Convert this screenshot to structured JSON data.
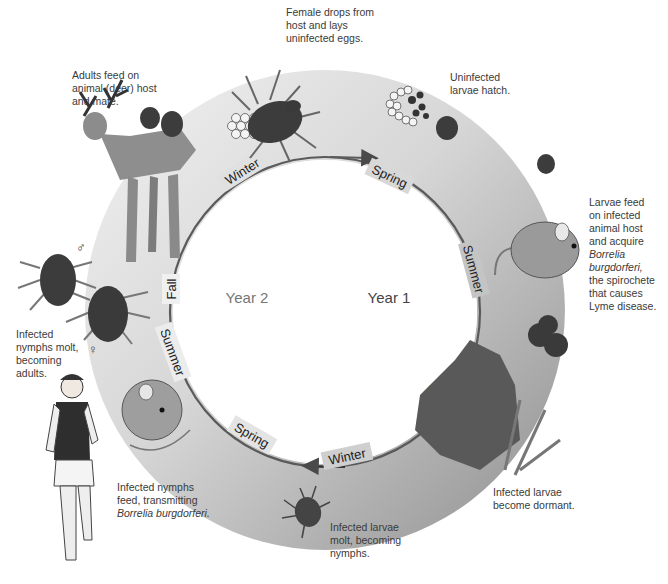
{
  "diagram": {
    "center_labels": {
      "year1": "Year 1",
      "year2": "Year 2"
    },
    "seasons": {
      "year1": [
        "Spring",
        "Summer",
        "Fall",
        "Winter"
      ],
      "year2": [
        "Spring",
        "Summer",
        "Fall",
        "Winter"
      ]
    },
    "colors": {
      "ring_light": "#e6e6e6",
      "ring_dark": "#9a9a9a",
      "arc_line": "#5a5a5a",
      "tick_body": "#3c3c3c",
      "caption_text": "#3a3a3a",
      "year_text": "#777777"
    },
    "stages": [
      {
        "id": "eggs",
        "lines": [
          "Female drops from",
          "host and lays",
          "uninfected eggs."
        ]
      },
      {
        "id": "hatch",
        "lines": [
          "Uninfected",
          "larvae hatch."
        ]
      },
      {
        "id": "larvae-feed",
        "lines": [
          "Larvae feed",
          "on infected",
          "animal host",
          "and acquire"
        ],
        "italic_lines": [
          "Borrelia",
          "burgdorferi,"
        ],
        "tail_lines": [
          "the spirochete",
          "that causes",
          "Lyme disease."
        ]
      },
      {
        "id": "dormant",
        "lines": [
          "Infected larvae",
          "become dormant."
        ]
      },
      {
        "id": "larvae-molt",
        "lines": [
          "Infected larvae",
          "molt, becoming",
          "nymphs."
        ]
      },
      {
        "id": "nymphs-feed",
        "lines": [
          "Infected nymphs",
          "feed, transmitting"
        ],
        "italic_lines": [
          "Borrelia burgdorferi."
        ]
      },
      {
        "id": "nymphs-molt",
        "lines": [
          "Infected",
          "nymphs molt,",
          "becoming",
          "adults."
        ]
      },
      {
        "id": "adults-feed",
        "lines": [
          "Adults feed on",
          "animal (deer) host",
          "and mate."
        ]
      }
    ],
    "symbols": {
      "male": "♂",
      "female": "♀"
    }
  }
}
